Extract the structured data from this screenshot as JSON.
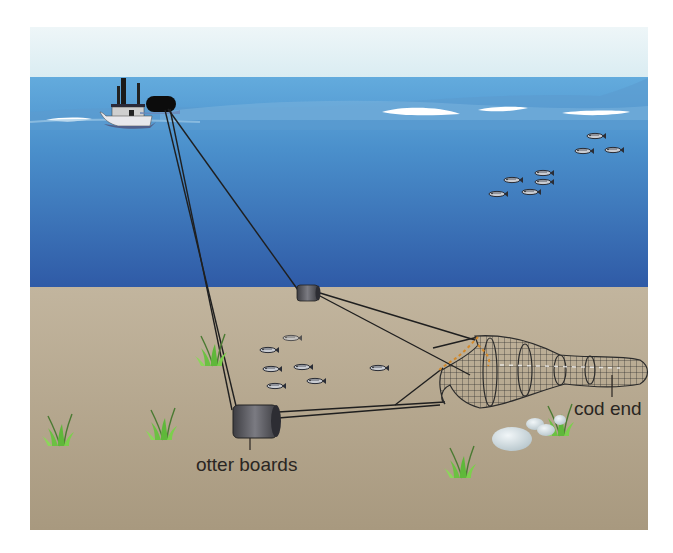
{
  "diagram": {
    "labels": {
      "otter_boards": "otter boards",
      "cod_end": "cod end"
    },
    "elements": {
      "vessel": "trawler-boat",
      "warps": "tow-cables",
      "net": "trawl-net",
      "fish_school_midwater": 8,
      "fish_near_seabed": 7
    },
    "colors": {
      "sky": "#e6f1f5",
      "water_surface": "#5aa4d8",
      "water_deep": "#2f5ea8",
      "seabed": "#b7a992",
      "boards": "#5a5a60",
      "net_lines": "#2b2b2b",
      "floats": "#d4892a",
      "grass": "#6cbf3f",
      "label_text": "#2a2622"
    }
  }
}
